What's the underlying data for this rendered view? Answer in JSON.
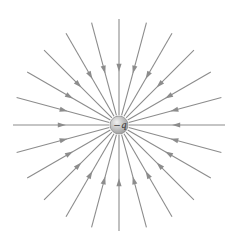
{
  "diagram": {
    "charge": {
      "label": "−q",
      "sign": "negative",
      "center": [
        119,
        125
      ],
      "radius": 9,
      "fill_light": "#f2f2f2",
      "fill_dark": "#9a9a9a",
      "stroke": "#8a8a8a"
    },
    "field_lines": {
      "count": 24,
      "direction": "inward",
      "inner_radius": 10,
      "outer_radius": 106,
      "arrow_position": 0.55,
      "color": "#8c8c8c",
      "stroke_width": 1.1
    },
    "background": "#ffffff"
  }
}
